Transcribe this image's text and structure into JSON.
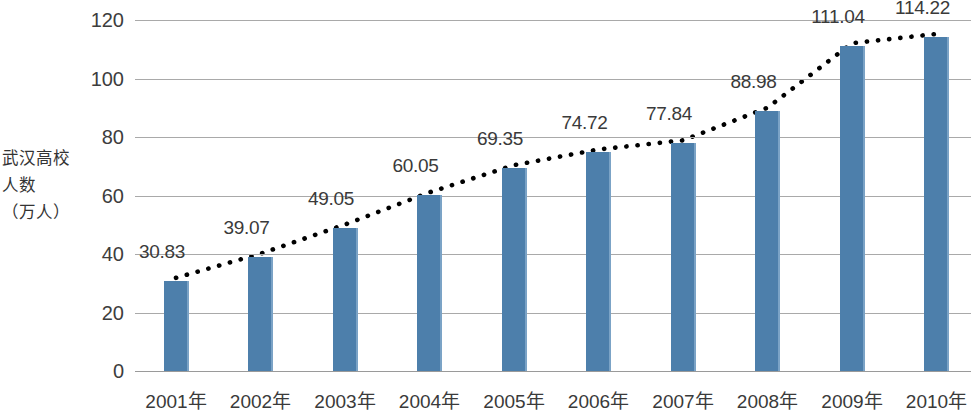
{
  "chart_data": {
    "type": "bar",
    "title": "",
    "xlabel": "",
    "ylabel": "武汉高校人数\n（万人）",
    "ylabel_lines": [
      "武汉高",
      "校人数",
      "（万人）"
    ],
    "categories": [
      "2001年",
      "2002年",
      "2003年",
      "2004年",
      "2005年",
      "2006年",
      "2007年",
      "2008年",
      "2009年",
      "2010年"
    ],
    "values": [
      30.83,
      39.07,
      49.05,
      60.05,
      69.35,
      74.72,
      77.84,
      88.98,
      111.04,
      114.22
    ],
    "value_labels": [
      "30.83",
      "39.07",
      "49.05",
      "60.05",
      "69.35",
      "74.72",
      "77.84",
      "88.98",
      "111.04",
      "114.22"
    ],
    "ylim": [
      0,
      120
    ],
    "yticks": [
      0,
      20,
      40,
      60,
      80,
      100,
      120
    ],
    "ytick_labels": [
      "0",
      "20",
      "40",
      "60",
      "80",
      "100",
      "120"
    ],
    "grid": true,
    "legend": "none",
    "series": [
      {
        "name": "武汉高校人数（万人）",
        "type": "bar",
        "color": "#4d7fab",
        "values": [
          30.83,
          39.07,
          49.05,
          60.05,
          69.35,
          74.72,
          77.84,
          88.98,
          111.04,
          114.22
        ]
      },
      {
        "name": "趋势线",
        "type": "line",
        "style": "dotted",
        "color": "#000000",
        "values": [
          30.83,
          39.07,
          49.05,
          60.05,
          69.35,
          74.72,
          77.84,
          88.98,
          111.04,
          114.22
        ]
      }
    ]
  },
  "colors": {
    "bar_fill": "#4d7fab",
    "bar_edge": "#7ba3c6",
    "gridline": "#a9a9a9",
    "trendline": "#000000",
    "text": "#3a3a3a",
    "background": "#ffffff"
  }
}
